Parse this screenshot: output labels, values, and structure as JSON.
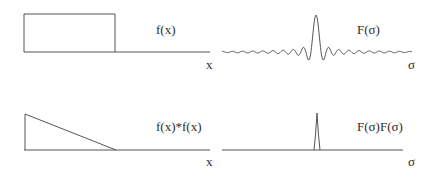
{
  "panels": [
    {
      "id": "top-left",
      "label": "f(x)",
      "axis": "x",
      "shape": "rectangle"
    },
    {
      "id": "top-right",
      "label": "F(σ)",
      "axis": "σ",
      "shape": "sinc"
    },
    {
      "id": "bottom-left",
      "label": "f(x)*f(x)",
      "axis": "x",
      "shape": "ramp-triangle"
    },
    {
      "id": "bottom-right",
      "label": "F(σ)F(σ)",
      "axis": "σ",
      "shape": "narrow-peak"
    }
  ],
  "colors": {
    "line": "#555555",
    "background": "#ffffff"
  }
}
